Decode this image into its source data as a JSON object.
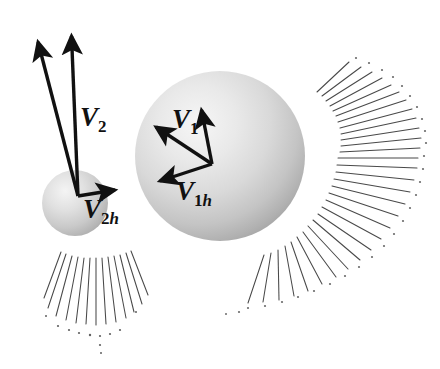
{
  "figure": {
    "background_color": "#ffffff",
    "width": 440,
    "height": 369
  },
  "labels": {
    "v2": {
      "base": "V",
      "sub": "2"
    },
    "v2h": {
      "base": "V",
      "sub": "2",
      "sub_italic": "h"
    },
    "v1": {
      "base": "V",
      "sub": "1"
    },
    "v1h": {
      "base": "V",
      "sub": "1",
      "sub_italic": "h"
    }
  },
  "colors": {
    "vector": "#111111",
    "sphere_light": "#f2f2f2",
    "sphere_mid": "#cfcfcf",
    "sphere_dark": "#a8a8a8",
    "hatch_line": "#3a3a3a",
    "background": "#ffffff"
  },
  "spheres": [
    {
      "name": "small-sphere",
      "cx": 75,
      "cy": 203,
      "r": 33,
      "highlight_cx": 62,
      "highlight_cy": 188
    },
    {
      "name": "large-sphere",
      "cx": 220,
      "cy": 156,
      "r": 85,
      "highlight_cx": 185,
      "highlight_cy": 110
    }
  ],
  "vectors": [
    {
      "name": "v2-resultant",
      "label": "V2",
      "origin": [
        78,
        196
      ],
      "tip": [
        35,
        33
      ],
      "attached_to": "small-sphere"
    },
    {
      "name": "v2-vertical",
      "label": "",
      "origin": [
        78,
        196
      ],
      "tip": [
        71,
        27
      ],
      "attached_to": "small-sphere"
    },
    {
      "name": "v2h-horizontal",
      "label": "V2h",
      "origin": [
        78,
        196
      ],
      "tip": [
        124,
        188
      ],
      "attached_to": "small-sphere"
    },
    {
      "name": "v1-resultant",
      "label": "V1",
      "origin": [
        212,
        164
      ],
      "tip": [
        148,
        122
      ],
      "attached_to": "large-sphere"
    },
    {
      "name": "v1-vertical",
      "label": "",
      "origin": [
        212,
        164
      ],
      "tip": [
        200,
        102
      ],
      "attached_to": "large-sphere"
    },
    {
      "name": "v1h-horizontal",
      "label": "V1h",
      "origin": [
        212,
        164
      ],
      "tip": [
        151,
        184
      ],
      "attached_to": "large-sphere"
    }
  ],
  "hatch_fans": [
    {
      "name": "small-sphere-hatch-fan",
      "origin_cx": 92,
      "origin_cy": 200,
      "inner_r": 58,
      "outer_r": 110,
      "angle_start": 62,
      "angle_end": 112,
      "line_count": 13
    },
    {
      "name": "large-sphere-hatch-fan",
      "origin_cx": 246,
      "origin_cy": 172,
      "inner_r": 92,
      "outer_r": 172,
      "angle_start": -28,
      "angle_end": 66,
      "line_count": 30
    }
  ]
}
